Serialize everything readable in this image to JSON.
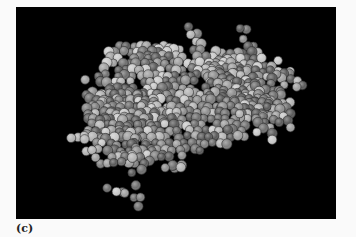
{
  "figure": {
    "label": "(c)",
    "panel_background": "#000000",
    "page_background": "#fafafa",
    "sphere_shades": [
      "#5a5a5a",
      "#6e6e6e",
      "#7f7f7f",
      "#8f8f8f",
      "#a0a0a0",
      "#b4b4b4",
      "#c8c8c8"
    ],
    "sphere_radius": 4.6,
    "cluster": {
      "center_x": 158,
      "center_y": 98,
      "body": [
        {
          "cx": 158,
          "cy": 95,
          "rx": 95,
          "ry": 58
        },
        {
          "cx": 110,
          "cy": 120,
          "rx": 48,
          "ry": 45
        },
        {
          "cx": 230,
          "cy": 75,
          "rx": 45,
          "ry": 35
        },
        {
          "cx": 255,
          "cy": 105,
          "rx": 20,
          "ry": 28
        },
        {
          "cx": 120,
          "cy": 45,
          "rx": 35,
          "ry": 12
        }
      ],
      "tails": [
        {
          "points": [
            [
              110,
              150
            ],
            [
              115,
              165
            ],
            [
              120,
              178
            ],
            [
              118,
              190
            ],
            [
              122,
              200
            ]
          ]
        },
        {
          "points": [
            [
              70,
              128
            ],
            [
              62,
              130
            ],
            [
              55,
              132
            ]
          ]
        },
        {
          "points": [
            [
              172,
              20
            ],
            [
              175,
              28
            ],
            [
              180,
              35
            ]
          ]
        },
        {
          "points": [
            [
              225,
              22
            ],
            [
              228,
              32
            ],
            [
              232,
              40
            ]
          ]
        },
        {
          "points": [
            [
              260,
              68
            ],
            [
              268,
              66
            ],
            [
              275,
              72
            ],
            [
              280,
              80
            ]
          ]
        },
        {
          "points": [
            [
              150,
              160
            ],
            [
              158,
              162
            ],
            [
              165,
              158
            ]
          ]
        },
        {
          "points": [
            [
              92,
              180
            ],
            [
              100,
              184
            ],
            [
              108,
              186
            ]
          ]
        }
      ]
    }
  }
}
